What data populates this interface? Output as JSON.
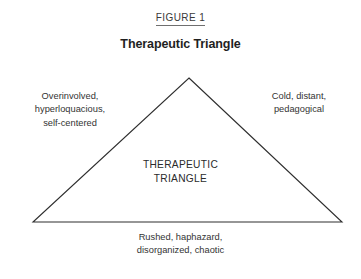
{
  "figure": {
    "label": "FIGURE 1",
    "title": "Therapeutic Triangle",
    "center_label": {
      "line1": "THERAPEUTIC",
      "line2": "TRIANGLE"
    },
    "annotations": {
      "left": {
        "line1": "Overinvolved,",
        "line2": "hyperloquacious,",
        "line3": "self-centered"
      },
      "right": {
        "line1": "Cold, distant,",
        "line2": "pedagogical"
      },
      "bottom": {
        "line1": "Rushed, haphazard,",
        "line2": "disorganized, chaotic"
      }
    },
    "colors": {
      "background": "#ffffff",
      "stroke": "#2e2e2e",
      "text": "#333333",
      "title_text": "#1f1f1f",
      "label_rule": "#6f6f6f"
    },
    "geometry": {
      "apex_x": 189,
      "apex_y": 78,
      "base_left_x": 33,
      "base_left_y": 222,
      "base_right_x": 342,
      "base_right_y": 222,
      "stroke_width": 1.1,
      "fill": "none"
    }
  }
}
